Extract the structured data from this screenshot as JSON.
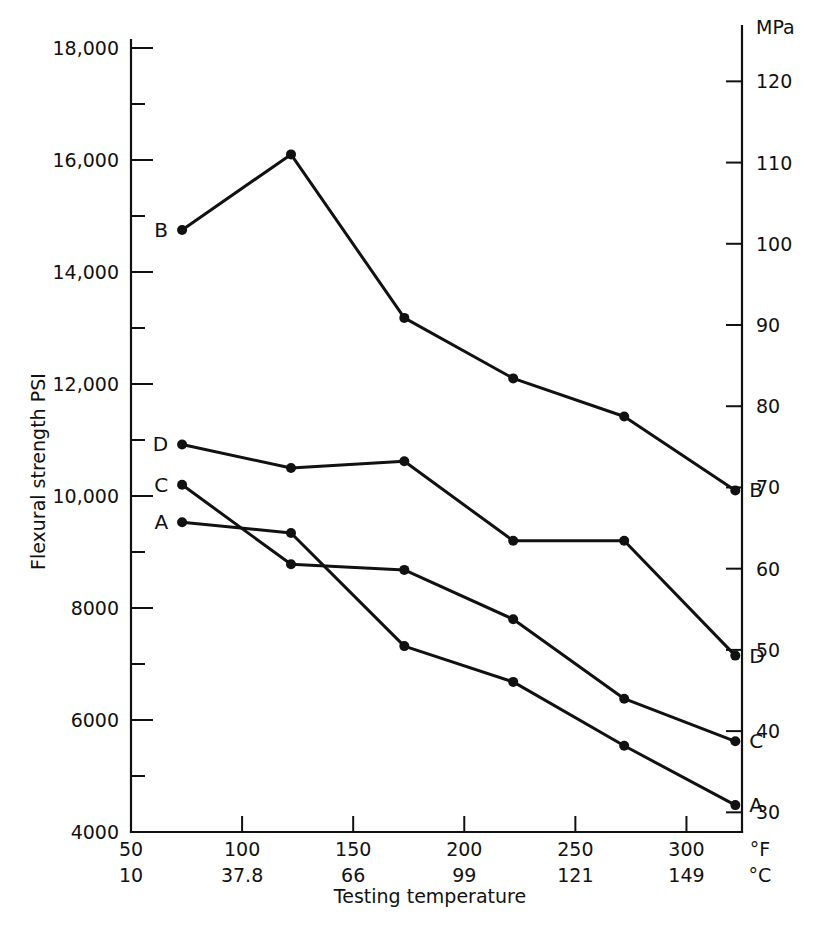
{
  "chart_data": {
    "type": "line",
    "title": "",
    "xlabel": "Testing temperature",
    "ylabel": "Flexural strength PSI",
    "y2label": "MPa",
    "xunit_primary": "°F",
    "xunit_secondary": "°C",
    "grid": false,
    "legend_position": "inline-endpoints",
    "xlim": [
      50,
      325
    ],
    "ylim": [
      4000,
      18000
    ],
    "y2lim": [
      27.6,
      124.1
    ],
    "x_ticks_f": [
      "50",
      "100",
      "150",
      "200",
      "250",
      "300"
    ],
    "x_ticks_c": [
      "10",
      "37.8",
      "66",
      "99",
      "121",
      "149"
    ],
    "y_ticks": [
      "4000",
      "6000",
      "8000",
      "10,000",
      "12,000",
      "14,000",
      "16,000",
      "18,000"
    ],
    "y_tick_values": [
      4000,
      6000,
      8000,
      10000,
      12000,
      14000,
      16000,
      18000
    ],
    "y_minor_values": [
      5000,
      7000,
      9000,
      11000,
      13000,
      15000,
      17000
    ],
    "y2_ticks": [
      "30",
      "40",
      "50",
      "60",
      "70",
      "80",
      "90",
      "100",
      "110",
      "120"
    ],
    "y2_tick_values": [
      30,
      40,
      50,
      60,
      70,
      80,
      90,
      100,
      110,
      120
    ],
    "x": [
      73,
      122,
      173,
      222,
      272,
      322
    ],
    "series": [
      {
        "name": "B",
        "label_start": "B",
        "label_end": "B",
        "values": [
          14750,
          16100,
          13180,
          12100,
          11420,
          10100
        ]
      },
      {
        "name": "D",
        "label_start": "D",
        "label_end": "D",
        "values": [
          10920,
          10500,
          10620,
          9200,
          9200,
          7150
        ]
      },
      {
        "name": "C",
        "label_start": "C",
        "label_end": "C",
        "values": [
          10200,
          8780,
          8680,
          7800,
          6380,
          5620
        ]
      },
      {
        "name": "A",
        "label_start": "A",
        "label_end": "A",
        "values": [
          9530,
          9340,
          7320,
          6680,
          5540,
          4480
        ]
      }
    ]
  }
}
